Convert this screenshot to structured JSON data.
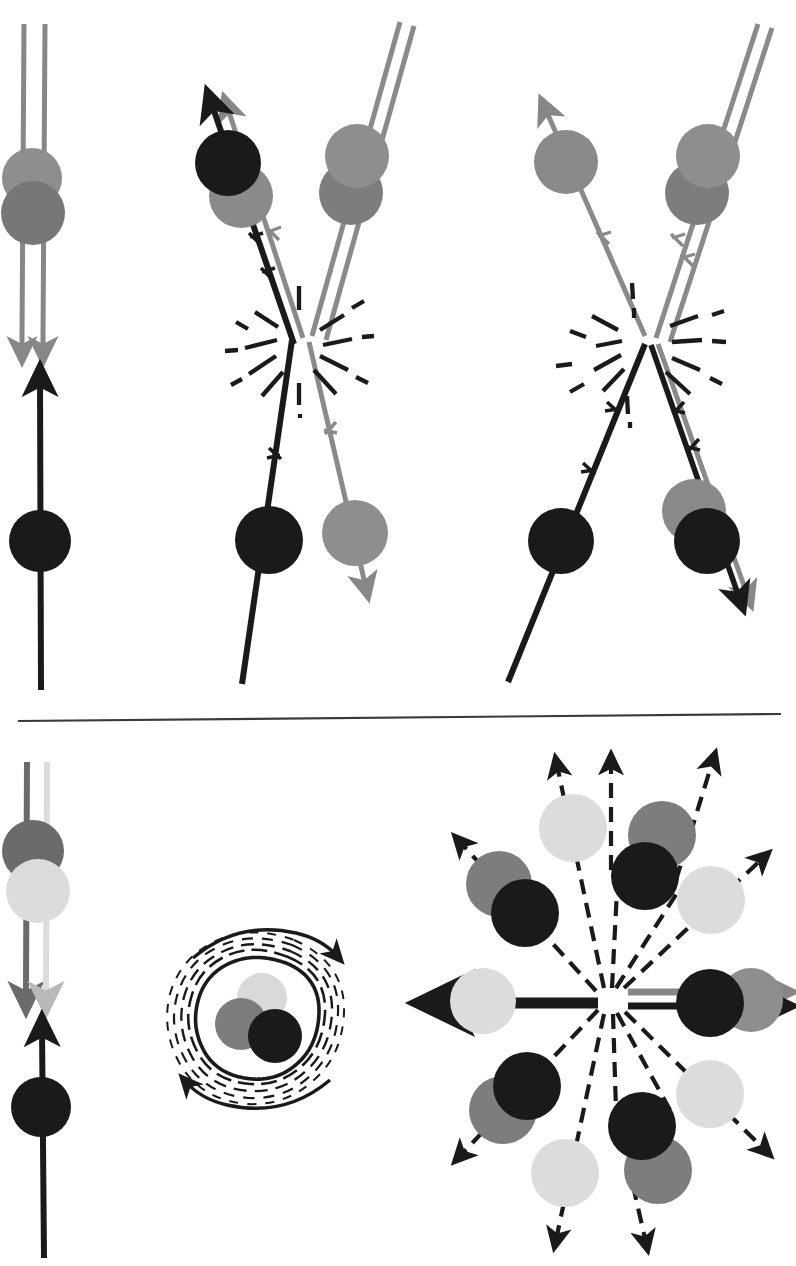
{
  "figure": {
    "domain": "scientific-diagram",
    "canvas": {
      "width": 796,
      "height": 1266,
      "background": "#ffffff"
    }
  },
  "palette": {
    "black": "#1a1a1a",
    "dark_gray": "#6b6b6b",
    "mid_gray": "#7d7d7d",
    "gray": "#878787",
    "light_gray": "#d9d9d9",
    "lighter_gray": "#e2e2e2",
    "divider": "#3a3a3a",
    "background": "#ffffff"
  },
  "divider": {
    "name": "horizontal-rule",
    "x1": 18,
    "y1": 721,
    "x2": 780,
    "y2": 714,
    "stroke_width": 2.2
  },
  "panels": [
    {
      "id": "panel-initial-state",
      "label": "initial state: incoming beam and target",
      "region": {
        "x": 0,
        "y": 20,
        "w": 150,
        "h": 670
      },
      "elements": {
        "beam_double_line": {
          "name": "double-line-beam-down",
          "color": "#878787",
          "x_left": 22,
          "x_right": 44,
          "y_top": 22,
          "y_bottom": 350,
          "arrow": "down",
          "stroke_width": 5
        },
        "beam_circles": [
          {
            "name": "circle-gray-light",
            "cx": 32,
            "cy": 178,
            "r": 29,
            "color": "#8a8a8a"
          },
          {
            "name": "circle-gray-dark",
            "cx": 33,
            "cy": 212,
            "r": 31,
            "color": "#767676"
          }
        ],
        "target_line": {
          "name": "single-line-target-up",
          "color": "#1a1a1a",
          "x": 41,
          "y_top": 372,
          "y_bottom": 690,
          "arrow": "up",
          "stroke_width": 6
        },
        "target_circle": {
          "name": "circle-black",
          "cx": 40,
          "cy": 541,
          "r": 31,
          "color": "#1a1a1a"
        }
      }
    },
    {
      "id": "panel-collision-v-left",
      "label": "collision: V-shaped outgoing tracks with starburst",
      "region": {
        "x": 160,
        "y": 60,
        "w": 250,
        "h": 630
      },
      "elements": {
        "vertex": {
          "name": "collision-vertex",
          "x": 296,
          "y": 338
        },
        "incoming_black": {
          "name": "track-black-upleft",
          "color": "#1a1a1a",
          "from": {
            "x": 296,
            "y": 338
          },
          "to": {
            "x": 205,
            "y": 98
          },
          "arrow": "up-left",
          "stroke_width": 6,
          "tick_marks": 2
        },
        "incoming_gray_parallel": {
          "name": "track-gray-upleft",
          "color": "#878787",
          "from": {
            "x": 310,
            "y": 335
          },
          "to": {
            "x": 224,
            "y": 96
          },
          "arrow": "up-left",
          "stroke_width": 5,
          "tick_marks": 1
        },
        "incoming_double_upright": {
          "name": "double-line-gray-upright",
          "color": "#878787",
          "from": {
            "x": 306,
            "y": 340
          },
          "to": {
            "x": 395,
            "y": 22
          },
          "stroke_width": 5
        },
        "outgoing_black_down": {
          "name": "track-black-downleft",
          "color": "#1a1a1a",
          "from": {
            "x": 292,
            "y": 345
          },
          "to": {
            "x": 245,
            "y": 680
          },
          "stroke_width": 6,
          "tick_marks": 1
        },
        "outgoing_gray_down": {
          "name": "track-gray-downright",
          "color": "#8a8a8a",
          "from": {
            "x": 308,
            "y": 345
          },
          "to": {
            "x": 364,
            "y": 590
          },
          "arrow": "down-right",
          "stroke_width": 5,
          "tick_marks": 1
        },
        "circles": [
          {
            "name": "circle-black-upper-left",
            "cx": 228,
            "cy": 163,
            "r": 32,
            "color": "#1a1a1a"
          },
          {
            "name": "circle-gray-upper-left",
            "cx": 241,
            "cy": 195,
            "r": 31,
            "color": "#878787"
          },
          {
            "name": "circle-gray-upper-right",
            "cx": 356,
            "cy": 155,
            "r": 31,
            "color": "#8a8a8a"
          },
          {
            "name": "circle-gray-upper-right-2",
            "cx": 352,
            "cy": 192,
            "r": 31,
            "color": "#7d7d7d"
          },
          {
            "name": "circle-black-lower-left",
            "cx": 269,
            "cy": 540,
            "r": 33,
            "color": "#1a1a1a"
          },
          {
            "name": "circle-gray-lower-right",
            "cx": 355,
            "cy": 533,
            "r": 32,
            "color": "#8a8a8a"
          }
        ],
        "starburst": {
          "name": "collision-starburst",
          "cx": 298,
          "cy": 340,
          "rays": 14
        }
      }
    },
    {
      "id": "panel-collision-v-right",
      "label": "collision: second V-shaped vertex with starburst",
      "region": {
        "x": 500,
        "y": 60,
        "w": 296,
        "h": 630
      },
      "elements": {
        "vertex": {
          "name": "collision-vertex",
          "x": 648,
          "y": 340
        },
        "incoming_gray_upleft": {
          "name": "track-gray-upleft",
          "color": "#878787",
          "from": {
            "x": 643,
            "y": 335
          },
          "to": {
            "x": 545,
            "y": 100
          },
          "arrow": "up-left",
          "stroke_width": 5,
          "tick_marks": 1
        },
        "incoming_double_upright": {
          "name": "double-line-gray-upright",
          "color": "#878787",
          "from": {
            "x": 654,
            "y": 338
          },
          "to": {
            "x": 760,
            "y": 22
          },
          "stroke_width": 5,
          "tick_marks": 2
        },
        "outgoing_black_downleft": {
          "name": "track-black-downleft",
          "color": "#1a1a1a",
          "from": {
            "x": 646,
            "y": 348
          },
          "to": {
            "x": 510,
            "y": 680
          },
          "stroke_width": 6,
          "tick_marks": 2
        },
        "outgoing_downright": {
          "name": "double-track-downright",
          "color_black": "#1a1a1a",
          "color_gray": "#878787",
          "from": {
            "x": 654,
            "y": 348
          },
          "to": {
            "x": 745,
            "y": 600
          },
          "arrow": "down-right",
          "stroke_width": 5,
          "tick_marks": 2
        },
        "circles": [
          {
            "name": "circle-gray-upper-left",
            "cx": 566,
            "cy": 162,
            "r": 31,
            "color": "#878787"
          },
          {
            "name": "circle-gray-upper-right",
            "cx": 709,
            "cy": 155,
            "r": 31,
            "color": "#8a8a8a"
          },
          {
            "name": "circle-gray-upper-right-2",
            "cx": 697,
            "cy": 192,
            "r": 31,
            "color": "#7d7d7d"
          },
          {
            "name": "circle-black-lower-left",
            "cx": 561,
            "cy": 541,
            "r": 32,
            "color": "#1a1a1a"
          },
          {
            "name": "circle-gray-lower-right",
            "cx": 697,
            "cy": 511,
            "r": 31,
            "color": "#878787"
          },
          {
            "name": "circle-black-lower-right",
            "cx": 707,
            "cy": 540,
            "r": 32,
            "color": "#1a1a1a"
          }
        ],
        "starburst": {
          "name": "collision-starburst",
          "cx": 650,
          "cy": 341,
          "rays": 14
        }
      }
    },
    {
      "id": "panel-lower-initial-state",
      "label": "lower initial state: beam and target",
      "region": {
        "x": 0,
        "y": 760,
        "w": 150,
        "h": 500
      },
      "elements": {
        "beam_double_line": {
          "name": "double-line-beam-down",
          "color_left": "#6b6b6b",
          "color_right": "#d9d9d9",
          "x_left": 26,
          "x_right": 46,
          "y_top": 762,
          "y_bottom": 1000,
          "arrow": "down",
          "stroke_width": 6
        },
        "beam_circles": [
          {
            "name": "circle-dark-gray",
            "cx": 33,
            "cy": 851,
            "r": 30,
            "color": "#6b6b6b"
          },
          {
            "name": "circle-light-gray",
            "cx": 37,
            "cy": 890,
            "r": 31,
            "color": "#dcdcdc"
          }
        ],
        "target_line": {
          "name": "single-line-target-up",
          "color": "#1a1a1a",
          "x": 43,
          "y_top": 1022,
          "y_bottom": 1258,
          "arrow": "up",
          "stroke_width": 6
        },
        "target_circle": {
          "name": "circle-black",
          "cx": 41,
          "cy": 1107,
          "r": 30,
          "color": "#1a1a1a"
        }
      }
    },
    {
      "id": "panel-rotating-blob",
      "label": "rotating composite system",
      "region": {
        "x": 180,
        "y": 900,
        "w": 180,
        "h": 190
      },
      "elements": {
        "circles": [
          {
            "name": "circle-light-gray",
            "cx": 262,
            "cy": 998,
            "r": 24,
            "color": "#d9d9d9"
          },
          {
            "name": "circle-mid-gray",
            "cx": 243,
            "cy": 1023,
            "r": 25,
            "color": "#7d7d7d"
          },
          {
            "name": "circle-black",
            "cx": 275,
            "cy": 1035,
            "r": 26,
            "color": "#1a1a1a"
          }
        ],
        "contours": {
          "name": "wavy-contour-rings",
          "count": 5,
          "cx": 262,
          "cy": 1017
        },
        "rotation_arrow_top": {
          "name": "rotation-arrow-clockwise-top",
          "direction": "clockwise"
        },
        "rotation_arrow_bottom": {
          "name": "rotation-arrow-clockwise-bottom",
          "direction": "clockwise"
        }
      }
    },
    {
      "id": "panel-radial-fragmentation",
      "label": "isotropic fragmentation into particle pairs",
      "region": {
        "x": 400,
        "y": 750,
        "w": 396,
        "h": 510
      },
      "elements": {
        "center": {
          "name": "fragmentation-center",
          "x": 611,
          "y": 1000
        },
        "horizontal_left_arrow": {
          "name": "arrow-left-solid-black",
          "color": "#1a1a1a",
          "from": {
            "x": 595,
            "y": 1003
          },
          "to": {
            "x": 432,
            "y": 1003
          },
          "stroke_width": 11
        },
        "horizontal_left_circle": {
          "name": "circle-light-gray",
          "cx": 483,
          "cy": 1001,
          "r": 32,
          "color": "#dcdcdc"
        },
        "horizontal_right_double": {
          "name": "double-arrow-right",
          "color_top": "#878787",
          "color_bottom": "#1a1a1a",
          "from": {
            "x": 627,
            "y": 996
          },
          "to": {
            "x": 790,
            "y": 996
          },
          "stroke_width": 7
        },
        "horizontal_right_circles": [
          {
            "name": "circle-black",
            "cx": 710,
            "cy": 1003,
            "r": 33,
            "color": "#1a1a1a"
          },
          {
            "name": "circle-gray",
            "cx": 751,
            "cy": 999,
            "r": 31,
            "color": "#878787"
          }
        ],
        "radial_arrows": [
          {
            "name": "dashed-arrow-up-left-steep",
            "angle_deg": 248
          },
          {
            "name": "dashed-arrow-up-left",
            "angle_deg": 217
          },
          {
            "name": "dashed-arrow-up",
            "angle_deg": 260
          },
          {
            "name": "dashed-arrow-up-right",
            "angle_deg": 285
          },
          {
            "name": "dashed-arrow-up-right-shallow",
            "angle_deg": 320
          },
          {
            "name": "dashed-arrow-down-left",
            "angle_deg": 147
          },
          {
            "name": "dashed-arrow-down-left-steep",
            "angle_deg": 110
          },
          {
            "name": "dashed-arrow-down",
            "angle_deg": 85
          },
          {
            "name": "dashed-arrow-down-right",
            "angle_deg": 60
          },
          {
            "name": "dashed-arrow-down-right-shallow",
            "angle_deg": 32
          }
        ],
        "fragment_pairs": [
          {
            "name": "pair-up-left-outer",
            "circles": [
              {
                "name": "circle-gray",
                "cx": 499,
                "cy": 884,
                "r": 32,
                "color": "#7d7d7d"
              },
              {
                "name": "circle-black",
                "cx": 524,
                "cy": 913,
                "r": 33,
                "color": "#1a1a1a"
              }
            ]
          },
          {
            "name": "pair-up-center-left",
            "circles": [
              {
                "name": "circle-light-gray",
                "cx": 573,
                "cy": 828,
                "r": 33,
                "color": "#dcdcdc"
              }
            ]
          },
          {
            "name": "pair-up-center-right",
            "circles": [
              {
                "name": "circle-gray",
                "cx": 659,
                "cy": 835,
                "r": 33,
                "color": "#7d7d7d"
              },
              {
                "name": "circle-black",
                "cx": 644,
                "cy": 876,
                "r": 33,
                "color": "#1a1a1a"
              }
            ]
          },
          {
            "name": "pair-up-right",
            "circles": [
              {
                "name": "circle-light-gray",
                "cx": 709,
                "cy": 900,
                "r": 33,
                "color": "#dcdcdc"
              }
            ]
          },
          {
            "name": "pair-down-left",
            "circles": [
              {
                "name": "circle-gray",
                "cx": 503,
                "cy": 1110,
                "r": 33,
                "color": "#7d7d7d"
              },
              {
                "name": "circle-black",
                "cx": 527,
                "cy": 1086,
                "r": 33,
                "color": "#1a1a1a"
              }
            ]
          },
          {
            "name": "pair-down-center-left",
            "circles": [
              {
                "name": "circle-light-gray",
                "cx": 565,
                "cy": 1173,
                "r": 33,
                "color": "#dcdcdc"
              }
            ]
          },
          {
            "name": "pair-down-center-right",
            "circles": [
              {
                "name": "circle-gray",
                "cx": 656,
                "cy": 1170,
                "r": 33,
                "color": "#7d7d7d"
              },
              {
                "name": "circle-black",
                "cx": 641,
                "cy": 1125,
                "r": 33,
                "color": "#1a1a1a"
              }
            ]
          },
          {
            "name": "pair-down-right",
            "circles": [
              {
                "name": "circle-light-gray",
                "cx": 708,
                "cy": 1095,
                "r": 33,
                "color": "#dcdcdc"
              }
            ]
          }
        ]
      }
    }
  ]
}
